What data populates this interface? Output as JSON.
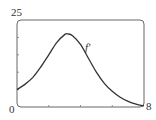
{
  "chart_data": {
    "type": "line",
    "title": "",
    "xlabel": "",
    "ylabel": "",
    "xlim": [
      0,
      8
    ],
    "ylim": [
      0,
      25
    ],
    "tick_labels": {
      "x_min": "0",
      "x_max": "8",
      "y_max": "25"
    },
    "grid": false,
    "series": [
      {
        "name": "f'",
        "x": [
          0,
          0.5,
          1,
          1.5,
          2,
          2.5,
          3,
          3.2,
          3.5,
          4,
          4.5,
          5,
          5.5,
          6,
          6.5,
          7,
          7.5,
          8
        ],
        "y": [
          5,
          6.5,
          8.5,
          11.5,
          15,
          18.5,
          20.8,
          21,
          20.5,
          18,
          14,
          10,
          6.8,
          4.5,
          2.8,
          1.6,
          0.8,
          0.3
        ]
      }
    ],
    "annotations": [
      {
        "text": "f'",
        "x": 4.1,
        "y": 18.5
      }
    ]
  },
  "labels": {
    "y_max": "25",
    "x_min": "0",
    "x_max": "8",
    "curve": "f'"
  }
}
